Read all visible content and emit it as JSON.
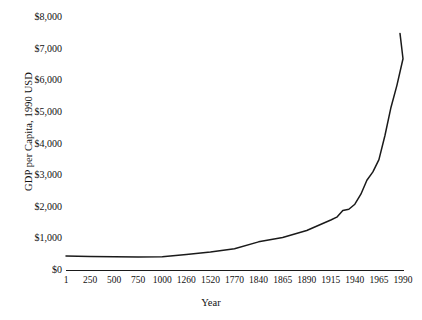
{
  "chart_data": {
    "type": "line",
    "title": "",
    "xlabel": "Year",
    "ylabel": "GDP per Capita, 1990 USD",
    "grid": false,
    "legend": null,
    "ylim": [
      0,
      8000
    ],
    "y_ticks": [
      {
        "label": "$8,000",
        "value": 8000
      },
      {
        "label": "$7,000",
        "value": 7000
      },
      {
        "label": "$6,000",
        "value": 6000
      },
      {
        "label": "$5,000",
        "value": 5000
      },
      {
        "label": "$4,000",
        "value": 4000
      },
      {
        "label": "$3,000",
        "value": 3000
      },
      {
        "label": "$2,000",
        "value": 2000
      },
      {
        "label": "$1,000",
        "value": 1000
      },
      {
        "label": "$0",
        "value": 0
      }
    ],
    "x_tick_labels": [
      "1",
      "250",
      "500",
      "750",
      "1000",
      "1260",
      "1520",
      "1770",
      "1840",
      "1865",
      "1890",
      "1915",
      "1940",
      "1965",
      "1990"
    ],
    "categories": [
      "1",
      "250",
      "500",
      "750",
      "1000",
      "1260",
      "1520",
      "1770",
      "1840",
      "1865",
      "1890",
      "1915",
      "1940",
      "1965",
      "1990"
    ],
    "series": [
      {
        "name": "GDP per Capita",
        "color": "#1a1a1a",
        "values": [
          440,
          430,
          420,
          415,
          420,
          490,
          570,
          670,
          890,
          1030,
          1250,
          1580,
          2080,
          3490,
          6680
        ],
        "points": [
          {
            "x": "1",
            "y": 440
          },
          {
            "x": "250",
            "y": 430
          },
          {
            "x": "500",
            "y": 420
          },
          {
            "x": "750",
            "y": 415
          },
          {
            "x": "1000",
            "y": 420
          },
          {
            "x": "1260",
            "y": 490
          },
          {
            "x": "1520",
            "y": 570
          },
          {
            "x": "1770",
            "y": 670
          },
          {
            "x": "1840",
            "y": 890
          },
          {
            "x": "1865",
            "y": 1030
          },
          {
            "x": "1890",
            "y": 1250
          },
          {
            "x": "1915",
            "y": 1580
          },
          {
            "x": "1940",
            "y": 2080
          },
          {
            "x": "1965",
            "y": 3490
          },
          {
            "x": "1990",
            "y": 6680
          }
        ]
      }
    ]
  }
}
